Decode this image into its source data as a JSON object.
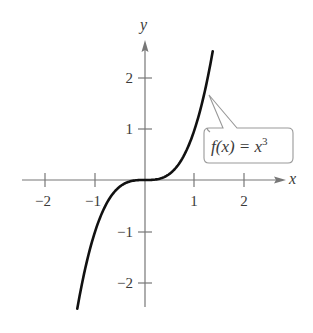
{
  "chart_data": {
    "type": "line",
    "title": "",
    "xlabel": "x",
    "ylabel": "y",
    "xlim": [
      -2.45,
      2.8
    ],
    "ylim": [
      -2.5,
      2.75
    ],
    "grid": false,
    "x_ticks": [
      -2,
      -1,
      1,
      2
    ],
    "y_ticks": [
      -2,
      -1,
      1,
      2
    ],
    "x_tick_labels": [
      "−2",
      "−1",
      "1",
      "2"
    ],
    "y_tick_labels": [
      "−2",
      "−1",
      "1",
      "2"
    ],
    "series": [
      {
        "name": "f(x) = x^3",
        "function": "x^3",
        "x_range": [
          -1.36,
          1.36
        ],
        "x": [
          -1.36,
          -1.2,
          -1.0,
          -0.8,
          -0.6,
          -0.4,
          -0.2,
          0,
          0.2,
          0.4,
          0.6,
          0.8,
          1.0,
          1.2,
          1.36
        ],
        "y": [
          -2.52,
          -1.73,
          -1.0,
          -0.51,
          -0.22,
          -0.06,
          -0.01,
          0,
          0.01,
          0.06,
          0.22,
          0.51,
          1.0,
          1.73,
          2.52
        ],
        "color": "#111111"
      }
    ],
    "annotations": [
      {
        "text_prefix": "f(x) = x",
        "exponent": "3",
        "points_to": [
          1.28,
          1.7
        ]
      }
    ]
  },
  "labels": {
    "x_axis": "x",
    "y_axis": "y",
    "x_ticks": [
      "−2",
      "−1",
      "1",
      "2"
    ],
    "y_ticks": [
      "2",
      "1",
      "−1",
      "−2"
    ],
    "function_prefix": "f(x) = x",
    "function_exponent": "3"
  }
}
